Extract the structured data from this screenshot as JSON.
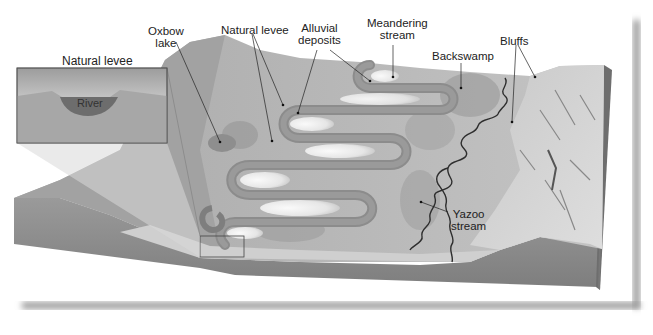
{
  "figure": {
    "colors": {
      "background": "#ffffff",
      "block_top": "#b4b4b4",
      "block_front": "#8e8e8e",
      "block_side": "#7a7a7a",
      "bluffs": "#d2d2d2",
      "channel": "#888888",
      "point_bar": "#ededed",
      "stream_line": "#333333",
      "river_fill": "#6b6b6b",
      "shadow": "#9a9a9a"
    }
  },
  "labels": {
    "oxbow_lake": {
      "line1": "Oxbow",
      "line2": "lake"
    },
    "natural_levee": "Natural levee",
    "alluvial_deposits": {
      "line1": "Alluvial",
      "line2": "deposits"
    },
    "meandering_stream": {
      "line1": "Meandering",
      "line2": "stream"
    },
    "backswamp": "Backswamp",
    "bluffs": "Bluffs",
    "yazoo_stream": {
      "line1": "Yazoo",
      "line2": "stream"
    }
  },
  "inset": {
    "title": "Natural levee",
    "river_label": "River"
  }
}
